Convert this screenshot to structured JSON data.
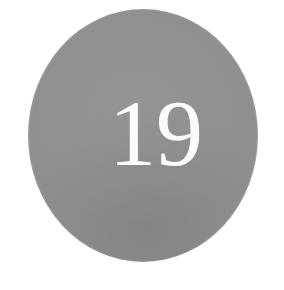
{
  "page": {
    "width": 284,
    "height": 290,
    "background_color": "#ffffff"
  },
  "badge": {
    "number": "19",
    "shape": "circle",
    "fill_color": "#aeaeae",
    "number_color": "#fbfbfb",
    "texture": "halftone-dither"
  }
}
